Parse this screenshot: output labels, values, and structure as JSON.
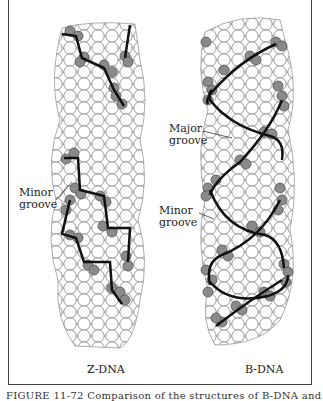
{
  "figure": {
    "panels": [
      {
        "label": "Z-DNA",
        "annotations": [
          {
            "text_line1": "Minor",
            "text_line2": "groove"
          }
        ]
      },
      {
        "label": "B-DNA",
        "annotations": [
          {
            "text_line1": "Major",
            "text_line2": "groove"
          },
          {
            "text_line1": "Minor",
            "text_line2": "groove"
          }
        ]
      }
    ],
    "caption": "FIGURE 11-72  Comparison of the structures of B-DNA and"
  },
  "colors": {
    "atom_fill": "#ffffff",
    "atom_stroke": "#777777",
    "phosphate_fill": "#8a8a8a",
    "backbone": "#111111"
  }
}
